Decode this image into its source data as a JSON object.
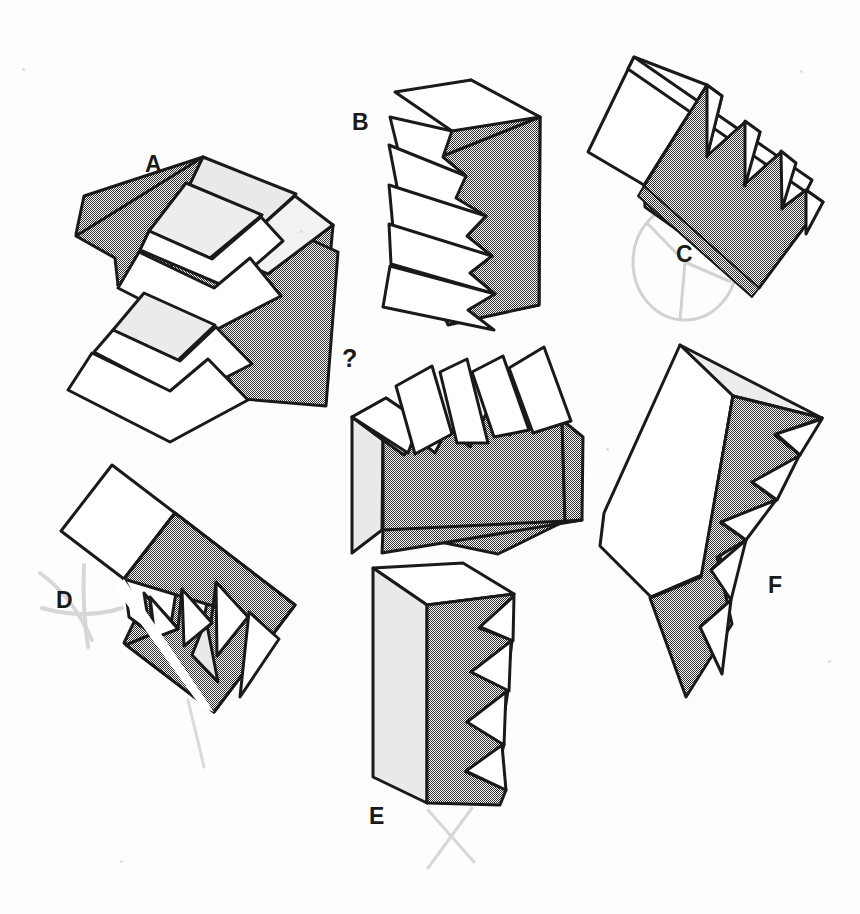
{
  "page": {
    "background_color": "#fdfdfd",
    "width": 860,
    "height": 914
  },
  "palette": {
    "outline": "#1a1a1a",
    "face_white": "#ffffff",
    "face_dark_gray": "#868686",
    "face_light_gray": "#e9e9e9",
    "pencil_mark": "#b9b9b9",
    "label_text": "#1a1a1a"
  },
  "question": {
    "marker": "?",
    "marker_position": {
      "x": 342,
      "y": 348
    },
    "description": "Unlabeled reference solid shown in the centre of the page"
  },
  "options": [
    {
      "id": "A",
      "label": "A",
      "label_position": {
        "x": 145,
        "y": 153
      },
      "teeth": 5,
      "marked": false,
      "mark_type": "none"
    },
    {
      "id": "B",
      "label": "B",
      "label_position": {
        "x": 352,
        "y": 111
      },
      "teeth": 6,
      "marked": false,
      "mark_type": "none"
    },
    {
      "id": "C",
      "label": "C",
      "label_position": {
        "x": 676,
        "y": 243
      },
      "teeth": 5,
      "marked": true,
      "mark_type": "circle-with-spokes"
    },
    {
      "id": "D",
      "label": "D",
      "label_position": {
        "x": 56,
        "y": 589
      },
      "teeth": 4,
      "marked": true,
      "mark_type": "cross-out"
    },
    {
      "id": "E",
      "label": "E",
      "label_position": {
        "x": 369,
        "y": 805
      },
      "teeth": 5,
      "marked": true,
      "mark_type": "cross-out"
    },
    {
      "id": "F",
      "label": "F",
      "label_position": {
        "x": 768,
        "y": 574
      },
      "teeth": 5,
      "marked": false,
      "mark_type": "none"
    }
  ],
  "annotations": [
    {
      "name": "pencil-circle-c",
      "kind": "circle-with-spokes",
      "cx": 685,
      "cy": 262,
      "rx": 52,
      "ry": 58
    },
    {
      "name": "pencil-cross-d",
      "kind": "cross-out",
      "cx": 62,
      "cy": 595
    },
    {
      "name": "pencil-stroke-d-tail",
      "kind": "stroke",
      "x1": 188,
      "y1": 700,
      "x2": 204,
      "y2": 767
    },
    {
      "name": "pencil-cross-e",
      "kind": "cross-out",
      "cx": 452,
      "cy": 833
    }
  ]
}
